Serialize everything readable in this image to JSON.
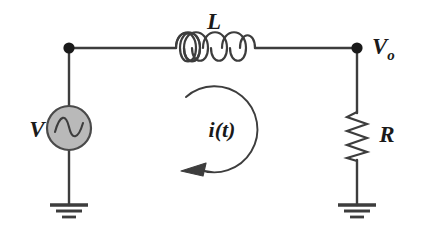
{
  "diagram": {
    "kind": "rl-series-circuit-schematic",
    "canvas": {
      "width": 422,
      "height": 234
    },
    "background_color": "#ffffff",
    "line_color": "#3d3d3d",
    "label_color": "#1a1a1a",
    "node_color": "#1a1a1a",
    "source_fill_color": "#b9b9b9",
    "source_stroke_color": "#4a4a4a"
  },
  "labels": {
    "inductor": "L",
    "source": "V",
    "resistor": "R",
    "output_main": "V",
    "output_subscript": "o",
    "current": "i(t)"
  },
  "components": [
    {
      "id": "voltage-source",
      "type": "ac-voltage-source",
      "label": "V",
      "cx": 69,
      "cy": 128,
      "r": 22,
      "fill": "#b9b9b9",
      "glyph": "sine-wave"
    },
    {
      "id": "inductor",
      "type": "inductor",
      "label": "L",
      "x_start": 175,
      "x_end": 256,
      "y": 48,
      "coil_count": 4
    },
    {
      "id": "resistor",
      "type": "resistor",
      "label": "R",
      "x": 357,
      "y_start": 112,
      "y_end": 161,
      "zigzag_count": 7
    },
    {
      "id": "ground-left",
      "type": "ground",
      "x": 69,
      "y": 205,
      "bar_count": 3
    },
    {
      "id": "ground-right",
      "type": "ground",
      "x": 357,
      "y": 205,
      "bar_count": 3
    },
    {
      "id": "node-input",
      "type": "junction-dot",
      "cx": 69,
      "cy": 48,
      "r": 5.5
    },
    {
      "id": "node-output",
      "type": "junction-dot",
      "cx": 357,
      "cy": 48,
      "r": 5.5,
      "label": "Vo"
    },
    {
      "id": "current-loop",
      "type": "current-direction-arrow",
      "label": "i(t)",
      "cx": 222,
      "cy": 128,
      "r": 43,
      "direction": "counterclockwise"
    }
  ],
  "wires": [
    {
      "id": "wire-top-left",
      "x1": 69,
      "y1": 48,
      "x2": 175,
      "y2": 48
    },
    {
      "id": "wire-top-right",
      "x1": 256,
      "y1": 48,
      "x2": 357,
      "y2": 48
    },
    {
      "id": "wire-left-upper",
      "x1": 69,
      "y1": 48,
      "x2": 69,
      "y2": 106
    },
    {
      "id": "wire-left-lower",
      "x1": 69,
      "y1": 150,
      "x2": 69,
      "y2": 205
    },
    {
      "id": "wire-right-upper",
      "x1": 357,
      "y1": 48,
      "x2": 357,
      "y2": 112
    },
    {
      "id": "wire-right-lower",
      "x1": 357,
      "y1": 161,
      "x2": 357,
      "y2": 205
    }
  ]
}
